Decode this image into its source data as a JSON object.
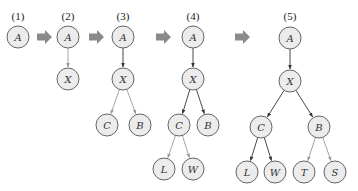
{
  "diagram": {
    "type": "tree-growth-sequence",
    "colors": {
      "node_fill": "#ececec",
      "node_stroke": "#555555",
      "edge_existing": "#333333",
      "edge_new": "#9a9a9a",
      "step_arrow": "#8a8a8a"
    },
    "steps": [
      {
        "label": "(1)",
        "label_pos": [
          18,
          20
        ],
        "nodes": [
          {
            "id": "A",
            "label": "A",
            "x": 18,
            "y": 37
          }
        ],
        "edges": []
      },
      {
        "label": "(2)",
        "label_pos": [
          68,
          20
        ],
        "nodes": [
          {
            "id": "A",
            "label": "A",
            "x": 68,
            "y": 37
          },
          {
            "id": "X",
            "label": "X",
            "x": 68,
            "y": 79
          }
        ],
        "edges": [
          {
            "from": "A",
            "to": "X",
            "style": "light"
          }
        ]
      },
      {
        "label": "(3)",
        "label_pos": [
          123,
          20
        ],
        "nodes": [
          {
            "id": "A",
            "label": "A",
            "x": 123,
            "y": 37
          },
          {
            "id": "X",
            "label": "X",
            "x": 123,
            "y": 79
          },
          {
            "id": "C",
            "label": "C",
            "x": 107,
            "y": 125
          },
          {
            "id": "B",
            "label": "B",
            "x": 140,
            "y": 125
          }
        ],
        "edges": [
          {
            "from": "A",
            "to": "X",
            "style": "dark"
          },
          {
            "from": "X",
            "to": "C",
            "style": "light"
          },
          {
            "from": "X",
            "to": "B",
            "style": "light"
          }
        ]
      },
      {
        "label": "(4)",
        "label_pos": [
          193,
          20
        ],
        "nodes": [
          {
            "id": "A",
            "label": "A",
            "x": 193,
            "y": 37
          },
          {
            "id": "X",
            "label": "X",
            "x": 193,
            "y": 79
          },
          {
            "id": "C",
            "label": "C",
            "x": 179,
            "y": 125
          },
          {
            "id": "B",
            "label": "B",
            "x": 208,
            "y": 125
          },
          {
            "id": "L",
            "label": "L",
            "x": 164,
            "y": 169
          },
          {
            "id": "W",
            "label": "W",
            "x": 193,
            "y": 169
          }
        ],
        "edges": [
          {
            "from": "A",
            "to": "X",
            "style": "dark"
          },
          {
            "from": "X",
            "to": "C",
            "style": "dark"
          },
          {
            "from": "X",
            "to": "B",
            "style": "dark"
          },
          {
            "from": "C",
            "to": "L",
            "style": "light"
          },
          {
            "from": "C",
            "to": "W",
            "style": "light"
          }
        ]
      },
      {
        "label": "(5)",
        "label_pos": [
          290,
          20
        ],
        "nodes": [
          {
            "id": "A",
            "label": "A",
            "x": 290,
            "y": 38
          },
          {
            "id": "X",
            "label": "X",
            "x": 290,
            "y": 81
          },
          {
            "id": "C",
            "label": "C",
            "x": 261,
            "y": 127
          },
          {
            "id": "B",
            "label": "B",
            "x": 319,
            "y": 127
          },
          {
            "id": "L",
            "label": "L",
            "x": 247,
            "y": 172
          },
          {
            "id": "W",
            "label": "W",
            "x": 275,
            "y": 172
          },
          {
            "id": "T",
            "label": "T",
            "x": 304,
            "y": 172
          },
          {
            "id": "S",
            "label": "S",
            "x": 335,
            "y": 172
          }
        ],
        "edges": [
          {
            "from": "A",
            "to": "X",
            "style": "dark"
          },
          {
            "from": "X",
            "to": "C",
            "style": "dark"
          },
          {
            "from": "X",
            "to": "B",
            "style": "dark"
          },
          {
            "from": "C",
            "to": "L",
            "style": "dark"
          },
          {
            "from": "C",
            "to": "W",
            "style": "dark"
          },
          {
            "from": "B",
            "to": "T",
            "style": "light"
          },
          {
            "from": "B",
            "to": "S",
            "style": "light"
          }
        ]
      }
    ],
    "step_arrows": [
      {
        "x": 37,
        "y": 37
      },
      {
        "x": 89,
        "y": 37
      },
      {
        "x": 156,
        "y": 37
      },
      {
        "x": 235,
        "y": 37
      }
    ],
    "node_radius": 11
  }
}
